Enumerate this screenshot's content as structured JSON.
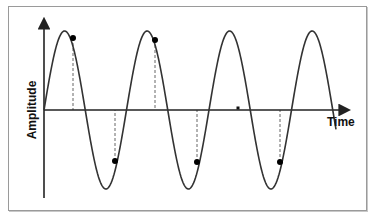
{
  "chart_data": {
    "type": "line",
    "title": "",
    "xlabel": "Time",
    "ylabel": "Amplitude",
    "grid": false,
    "legend": null,
    "curve": "sine",
    "cycles": 3.5,
    "x_range_px": [
      44,
      336
    ],
    "axis_y_px": 110,
    "amplitude_px": 79,
    "period_px": 82.5,
    "sample_points": [
      {
        "label": "sample-1",
        "x": 73,
        "y": 38,
        "position": "just after peak 1"
      },
      {
        "label": "sample-2",
        "x": 115,
        "y": 161,
        "position": "just after trough 1"
      },
      {
        "label": "sample-3",
        "x": 155,
        "y": 40,
        "position": "just after peak 2"
      },
      {
        "label": "sample-4",
        "x": 197,
        "y": 162,
        "position": "just after trough 2"
      },
      {
        "label": "sample-5",
        "x": 280,
        "y": 162,
        "position": "just after trough 3"
      }
    ],
    "marker": {
      "x": 238,
      "y": 108
    },
    "colors": {
      "curve": "#333333",
      "axes": "#222222",
      "points": "#000000",
      "dashes": "#666666"
    }
  },
  "labels": {
    "x_axis": "Time",
    "y_axis": "Amplitude"
  }
}
